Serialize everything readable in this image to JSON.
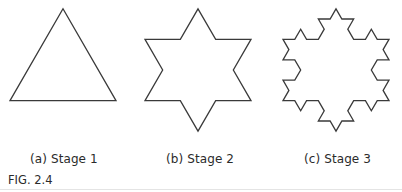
{
  "figure": {
    "caption": "FIG. 2.4",
    "stroke_color": "#3a3a3a",
    "stroke_width": 1.3,
    "panels": [
      {
        "id": "a",
        "label": "(a) Stage 1",
        "stage": 1,
        "shape": "equilateral-triangle",
        "center": [
          63,
          70
        ],
        "side": 106
      },
      {
        "id": "b",
        "label": "(b) Stage 2",
        "stage": 2,
        "shape": "six-pointed-star",
        "center": [
          198,
          70
        ],
        "side": 106
      },
      {
        "id": "c",
        "label": "(c) Stage 3",
        "stage": 3,
        "shape": "koch-snowflake",
        "center": [
          336,
          70
        ],
        "side": 106
      }
    ]
  }
}
